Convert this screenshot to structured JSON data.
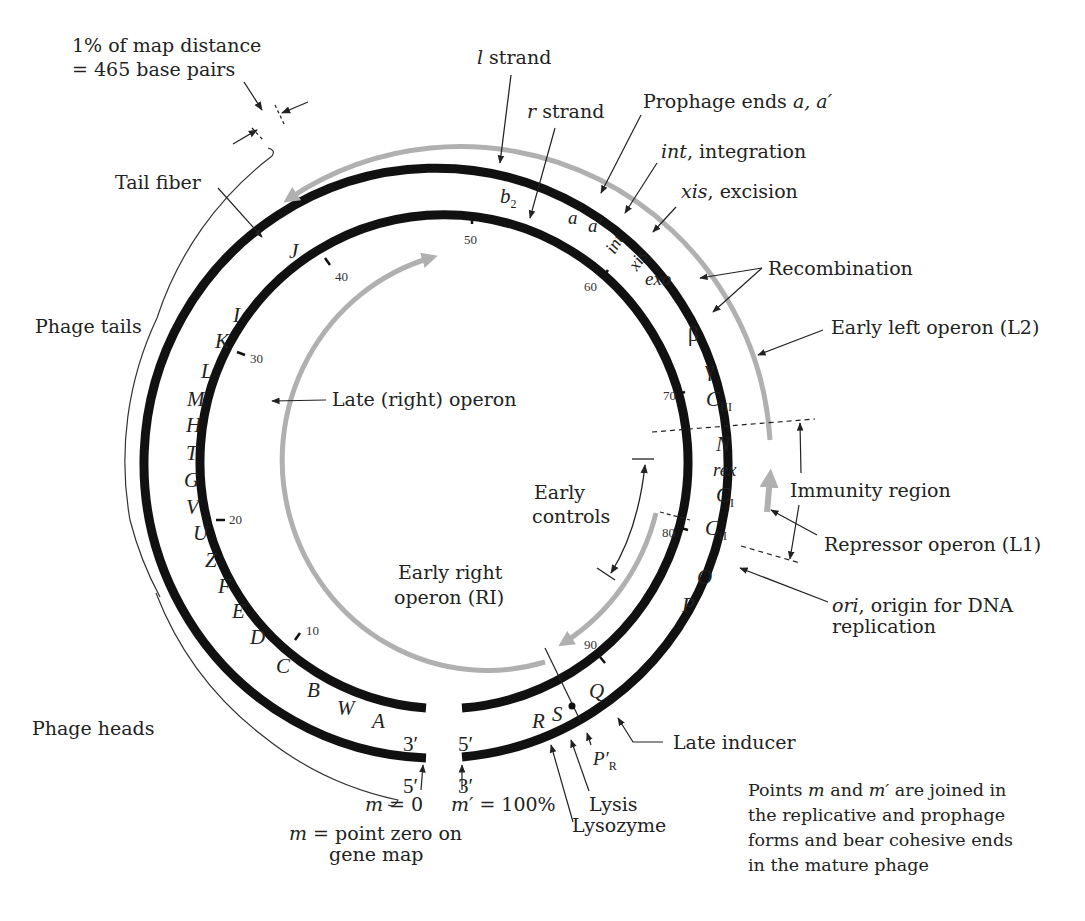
{
  "figure": {
    "scale_note": {
      "line1": "1% of map distance",
      "line2": "= 465 base pairs"
    },
    "strands": {
      "l": "l",
      "l_suffix": " strand",
      "r": "r",
      "r_suffix": " strand"
    },
    "callouts": {
      "tail_fiber": "Tail fiber",
      "phage_tails": "Phage tails",
      "phage_heads": "Phage heads",
      "prophage_ends": "Prophage ends ",
      "prophage_ends_genes": "a, a′",
      "int_gene": "int",
      "int_desc": ", integration",
      "xis_gene": "xis",
      "xis_desc": ", excision",
      "recombination": "Recombination",
      "early_left_operon": "Early left operon (L2)",
      "immunity_region": "Immunity region",
      "repressor_operon": "Repressor operon (L1)",
      "ori_gene": "ori",
      "ori_desc_1": ", origin for DNA",
      "ori_desc_2": "replication",
      "late_inducer": "Late inducer",
      "lysis": "Lysis",
      "lysozyme": "Lysozyme",
      "late_right_operon": "Late (right) operon",
      "early_controls_1": "Early",
      "early_controls_2": "controls",
      "early_right_operon_1": "Early right",
      "early_right_operon_2": "operon (RI)",
      "m_zero": "m",
      "m_zero_val": " = 0",
      "m_prime": "m′",
      "m_prime_val": " = 100%",
      "m_def_m": "m",
      "m_def_1": " = point zero on",
      "m_def_2": "gene map"
    },
    "ends": {
      "inner_left": "3′",
      "inner_right": "5′",
      "outer_left": "5′",
      "outer_right": "3′"
    },
    "genes_outer_left": [
      "J",
      "I",
      "K",
      "L",
      "M",
      "H",
      "T",
      "G",
      "V",
      "U",
      "Z",
      "F",
      "E",
      "D",
      "C",
      "B",
      "W",
      "A"
    ],
    "genes_top": [
      "b",
      "2"
    ],
    "genes_right": {
      "a": "a",
      "a_prime": "a′",
      "int": "int",
      "xis": "xis",
      "exo": "exo",
      "beta": "β",
      "gamma": "γ",
      "cIII": "C",
      "cIII_sub": "III",
      "N": "N",
      "rex": "rex",
      "cI": "C",
      "cI_sub": "I",
      "cII": "C",
      "cII_sub": "II",
      "O": "O",
      "P": "P",
      "Q": "Q",
      "S": "S",
      "R": "R",
      "PR": "P′",
      "PR_sub": "R"
    },
    "map_ticks": [
      "10",
      "20",
      "30",
      "40",
      "50",
      "60",
      "70",
      "80",
      "90"
    ],
    "note": {
      "line1_a": "Points ",
      "line1_m": "m",
      "line1_b": " and ",
      "line1_mp": "m′",
      "line1_c": " are joined in",
      "line2": "the replicative and prophage",
      "line3": "forms and bear cohesive ends",
      "line4": "in the mature phage"
    },
    "colors": {
      "dna": "#111111",
      "operon": "#b0b0b0",
      "text": "#222222"
    }
  }
}
